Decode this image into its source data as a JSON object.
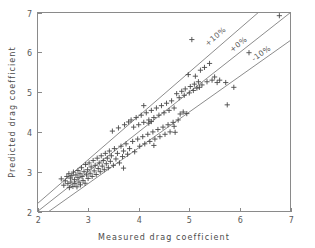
{
  "chart_data": {
    "type": "scatter",
    "title": "",
    "xlabel": "Measured drag coefficient",
    "ylabel": "Predicted drag coefficient",
    "xlim": [
      2,
      7
    ],
    "ylim": [
      2,
      7
    ],
    "xticks": [
      2,
      3,
      4,
      5,
      6,
      7
    ],
    "yticks": [
      2,
      3,
      4,
      5,
      6,
      7
    ],
    "xtick_labels": [
      "2",
      "3",
      "4",
      "5",
      "6",
      "7"
    ],
    "ytick_labels": [
      "2",
      "3",
      "4",
      "5",
      "6",
      "7"
    ],
    "grid": false,
    "legend_position": "none",
    "marker": "plus",
    "marker_color": "#4a4a4a",
    "line_color": "#6f6f6f",
    "axis_color": "#8a8a8a",
    "background_color": "#ffffff",
    "reference_lines": [
      {
        "name": "+10%",
        "label": "+10%",
        "slope": 1.1,
        "intercept": 0.0,
        "label_x": 5.55,
        "label_y": 6.35
      },
      {
        "name": "+0%",
        "label": "+0%",
        "slope": 1.0,
        "intercept": 0.0,
        "label_x": 6.0,
        "label_y": 6.15
      },
      {
        "name": "-10%",
        "label": "-10%",
        "slope": 0.9,
        "intercept": 0.0,
        "label_x": 6.45,
        "label_y": 5.92
      }
    ],
    "points": [
      [
        2.47,
        2.82
      ],
      [
        2.52,
        2.66
      ],
      [
        2.55,
        2.77
      ],
      [
        2.58,
        2.88
      ],
      [
        2.6,
        2.7
      ],
      [
        2.62,
        2.95
      ],
      [
        2.63,
        2.6
      ],
      [
        2.65,
        2.84
      ],
      [
        2.66,
        2.74
      ],
      [
        2.68,
        2.9
      ],
      [
        2.7,
        2.63
      ],
      [
        2.71,
        2.99
      ],
      [
        2.73,
        2.8
      ],
      [
        2.74,
        2.7
      ],
      [
        2.76,
        2.92
      ],
      [
        2.78,
        2.62
      ],
      [
        2.8,
        3.03
      ],
      [
        2.8,
        2.85
      ],
      [
        2.82,
        2.74
      ],
      [
        2.84,
        2.95
      ],
      [
        2.85,
        2.67
      ],
      [
        2.87,
        3.1
      ],
      [
        2.88,
        2.88
      ],
      [
        2.9,
        2.78
      ],
      [
        2.92,
        3.0
      ],
      [
        2.94,
        2.71
      ],
      [
        2.95,
        3.18
      ],
      [
        2.97,
        2.92
      ],
      [
        2.99,
        3.05
      ],
      [
        3.0,
        2.83
      ],
      [
        3.02,
        3.22
      ],
      [
        3.04,
        2.96
      ],
      [
        3.06,
        3.12
      ],
      [
        3.08,
        2.88
      ],
      [
        3.1,
        3.28
      ],
      [
        3.12,
        3.02
      ],
      [
        3.14,
        3.16
      ],
      [
        3.16,
        2.93
      ],
      [
        3.18,
        3.34
      ],
      [
        3.2,
        3.08
      ],
      [
        3.22,
        3.22
      ],
      [
        3.24,
        3.0
      ],
      [
        3.26,
        3.4
      ],
      [
        3.28,
        3.14
      ],
      [
        3.3,
        3.28
      ],
      [
        3.32,
        3.05
      ],
      [
        3.34,
        3.46
      ],
      [
        3.36,
        3.2
      ],
      [
        3.38,
        3.34
      ],
      [
        3.4,
        3.1
      ],
      [
        3.42,
        3.52
      ],
      [
        3.44,
        3.26
      ],
      [
        3.46,
        3.4
      ],
      [
        3.48,
        4.02
      ],
      [
        3.5,
        3.16
      ],
      [
        3.52,
        3.58
      ],
      [
        3.55,
        3.32
      ],
      [
        3.58,
        3.46
      ],
      [
        3.6,
        4.1
      ],
      [
        3.62,
        3.22
      ],
      [
        3.65,
        3.64
      ],
      [
        3.68,
        3.38
      ],
      [
        3.7,
        3.52
      ],
      [
        3.7,
        3.09
      ],
      [
        3.72,
        4.18
      ],
      [
        3.75,
        3.7
      ],
      [
        3.78,
        3.44
      ],
      [
        3.8,
        4.25
      ],
      [
        3.82,
        3.58
      ],
      [
        3.85,
        4.3
      ],
      [
        3.88,
        3.76
      ],
      [
        3.9,
        4.12
      ],
      [
        3.92,
        3.5
      ],
      [
        3.95,
        4.36
      ],
      [
        3.98,
        3.82
      ],
      [
        4.0,
        4.18
      ],
      [
        4.02,
        3.64
      ],
      [
        4.05,
        4.42
      ],
      [
        4.08,
        3.88
      ],
      [
        4.1,
        4.24
      ],
      [
        4.1,
        4.66
      ],
      [
        4.12,
        3.7
      ],
      [
        4.15,
        4.48
      ],
      [
        4.18,
        3.94
      ],
      [
        4.2,
        4.3
      ],
      [
        4.2,
        4.22
      ],
      [
        4.22,
        3.76
      ],
      [
        4.25,
        4.54
      ],
      [
        4.25,
        4.26
      ],
      [
        4.28,
        4.0
      ],
      [
        4.3,
        4.36
      ],
      [
        4.3,
        3.66
      ],
      [
        4.32,
        3.82
      ],
      [
        4.35,
        4.6
      ],
      [
        4.38,
        4.06
      ],
      [
        4.4,
        4.42
      ],
      [
        4.42,
        3.88
      ],
      [
        4.45,
        4.66
      ],
      [
        4.48,
        4.12
      ],
      [
        4.5,
        4.48
      ],
      [
        4.52,
        3.94
      ],
      [
        4.55,
        4.72
      ],
      [
        4.58,
        4.18
      ],
      [
        4.6,
        4.54
      ],
      [
        4.62,
        4.0
      ],
      [
        4.65,
        4.78
      ],
      [
        4.68,
        4.24
      ],
      [
        4.7,
        4.6
      ],
      [
        4.7,
        4.14
      ],
      [
        4.72,
        3.99
      ],
      [
        4.75,
        4.96
      ],
      [
        4.78,
        4.3
      ],
      [
        4.8,
        4.86
      ],
      [
        4.82,
        4.45
      ],
      [
        4.85,
        5.02
      ],
      [
        4.88,
        4.5
      ],
      [
        4.9,
        4.92
      ],
      [
        4.92,
        5.08
      ],
      [
        4.95,
        4.46
      ],
      [
        4.98,
        5.44
      ],
      [
        5.0,
        4.98
      ],
      [
        5.02,
        5.14
      ],
      [
        5.05,
        6.32
      ],
      [
        5.08,
        5.04
      ],
      [
        5.1,
        5.2
      ],
      [
        5.12,
        5.4
      ],
      [
        5.15,
        5.1
      ],
      [
        5.18,
        5.26
      ],
      [
        5.2,
        5.12
      ],
      [
        5.22,
        5.55
      ],
      [
        5.25,
        5.18
      ],
      [
        5.3,
        5.62
      ],
      [
        5.35,
        5.26
      ],
      [
        5.4,
        5.72
      ],
      [
        5.45,
        5.3
      ],
      [
        5.5,
        5.38
      ],
      [
        5.55,
        5.24
      ],
      [
        5.6,
        5.3
      ],
      [
        5.72,
        5.24
      ],
      [
        5.75,
        4.68
      ],
      [
        5.88,
        5.12
      ],
      [
        6.18,
        5.99
      ],
      [
        6.78,
        6.92
      ]
    ]
  }
}
